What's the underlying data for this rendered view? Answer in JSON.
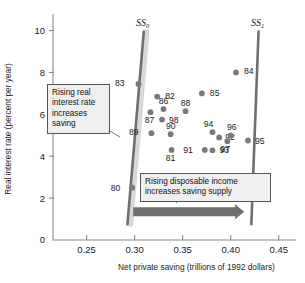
{
  "chart_data": {
    "type": "scatter",
    "title": "",
    "xlabel": "Net private saving (trillions of 1992 dollars)",
    "ylabel": "Real interest rate (percent per year)",
    "xlim": [
      0.215,
      0.468
    ],
    "ylim": [
      0,
      10.6
    ],
    "xticks": [
      "0.25",
      "0.30",
      "0.35",
      "0.40",
      "0.45"
    ],
    "xtick_values": [
      0.25,
      0.3,
      0.35,
      0.4,
      0.45
    ],
    "yticks": [
      "0",
      "2",
      "4",
      "6",
      "8",
      "10"
    ],
    "ytick_values": [
      0,
      2,
      4,
      6,
      8,
      10
    ],
    "grid": false,
    "legend": "none",
    "points": [
      {
        "label": "80",
        "x": 0.2975,
        "y": 2.5,
        "lx": -12,
        "ly": 3
      },
      {
        "label": "81",
        "x": 0.3385,
        "y": 4.3,
        "lx": -1,
        "ly": 11
      },
      {
        "label": "82",
        "x": 0.3235,
        "y": 6.85,
        "lx": 8,
        "ly": 2
      },
      {
        "label": "83",
        "x": 0.304,
        "y": 7.45,
        "lx": -14,
        "ly": 2
      },
      {
        "label": "84",
        "x": 0.4055,
        "y": 8.0,
        "lx": 8,
        "ly": 2
      },
      {
        "label": "85",
        "x": 0.37,
        "y": 7.0,
        "lx": 8,
        "ly": 3
      },
      {
        "label": "86",
        "x": 0.33,
        "y": 6.25,
        "lx": 0,
        "ly": -5
      },
      {
        "label": "87",
        "x": 0.3165,
        "y": 6.1,
        "lx": -1,
        "ly": 11
      },
      {
        "label": "88",
        "x": 0.353,
        "y": 6.15,
        "lx": 0,
        "ly": -5
      },
      {
        "label": "89",
        "x": 0.3175,
        "y": 5.1,
        "lx": -13,
        "ly": 2
      },
      {
        "label": "90",
        "x": 0.3375,
        "y": 5.05,
        "lx": 0,
        "ly": -5
      },
      {
        "label": "91",
        "x": 0.373,
        "y": 4.3,
        "lx": -12,
        "ly": 3
      },
      {
        "label": "92",
        "x": 0.388,
        "y": 4.9,
        "lx": 6,
        "ly": 3
      },
      {
        "label": "93",
        "x": 0.381,
        "y": 4.28,
        "lx": 7,
        "ly": 3
      },
      {
        "label": "94",
        "x": 0.381,
        "y": 5.15,
        "lx": -4,
        "ly": -5
      },
      {
        "label": "95",
        "x": 0.418,
        "y": 4.75,
        "lx": 7,
        "ly": 3
      },
      {
        "label": "96",
        "x": 0.4,
        "y": 5.0,
        "lx": 1,
        "ly": -5
      },
      {
        "label": "97",
        "x": 0.3965,
        "y": 4.72,
        "lx": -2,
        "ly": 11
      },
      {
        "label": "98",
        "x": 0.3285,
        "y": 5.75,
        "lx": 7,
        "ly": 3
      }
    ],
    "supply_curves": [
      {
        "name": "SS0",
        "label": "SS",
        "sub": "0",
        "x_bottom": 0.2925,
        "y_bottom": 0.75,
        "x_top": 0.3095,
        "y_top": 9.95
      },
      {
        "name": "SS1",
        "label": "SS",
        "sub": "1",
        "x_bottom": 0.4215,
        "y_bottom": 0.75,
        "x_top": 0.429,
        "y_top": 9.95
      }
    ],
    "annotations": [
      {
        "name": "rising-real-interest-rate",
        "text": "Rising real interest rate increases saving"
      },
      {
        "name": "rising-disposable-income",
        "text": "Rising disposable income increases saving supply"
      }
    ],
    "arrow": {
      "x_start": 0.2985,
      "x_end": 0.414,
      "y": 1.35,
      "direction": "right"
    },
    "colors": {
      "point": "#7a7a7a",
      "curve": "#6f6f6f",
      "axis": "#8a8a8a",
      "callout_bg": "#efefef",
      "callout_border": "#555555",
      "arrow": "#6f6f6f",
      "text": "#1a1a1a"
    }
  },
  "axis": {
    "xlabel": "Net private saving (trillions of 1992 dollars)",
    "ylabel": "Real interest rate (percent per year)"
  },
  "callouts": {
    "saving": "Rising real interest rate increases saving",
    "income": "Rising disposable income increases saving supply"
  }
}
